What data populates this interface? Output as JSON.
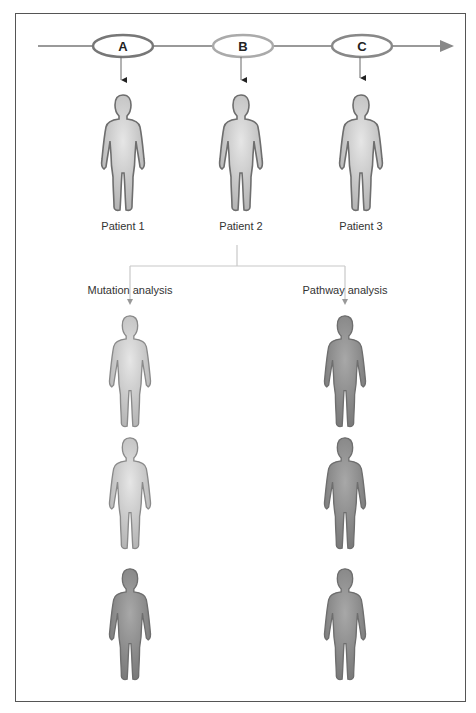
{
  "timeline": {
    "nodes": [
      {
        "id": "A",
        "label": "A",
        "cx": 123,
        "stroke": "#777777"
      },
      {
        "id": "B",
        "label": "B",
        "cx": 243,
        "stroke": "#aaaaaa"
      },
      {
        "id": "C",
        "label": "C",
        "cx": 362,
        "stroke": "#888888"
      }
    ]
  },
  "patients": [
    {
      "label": "Patient 1",
      "cx": 123
    },
    {
      "label": "Patient 2",
      "cx": 241
    },
    {
      "label": "Patient 3",
      "cx": 361
    }
  ],
  "branches": {
    "left": {
      "label": "Mutation analysis",
      "cx": 130
    },
    "right": {
      "label": "Pathway analysis",
      "cx": 345
    }
  },
  "results": {
    "mutation": [
      {
        "shade": "light"
      },
      {
        "shade": "light"
      },
      {
        "shade": "dark"
      }
    ],
    "pathway": [
      {
        "shade": "dark"
      },
      {
        "shade": "dark"
      },
      {
        "shade": "dark"
      }
    ]
  },
  "colors": {
    "light_fill": "#cfcfcf",
    "light_stroke": "#8a8a8a",
    "dark_fill": "#8a8a8a",
    "dark_stroke": "#6e6e6e",
    "line": "#999999",
    "branch_line": "#c8c8c8"
  }
}
